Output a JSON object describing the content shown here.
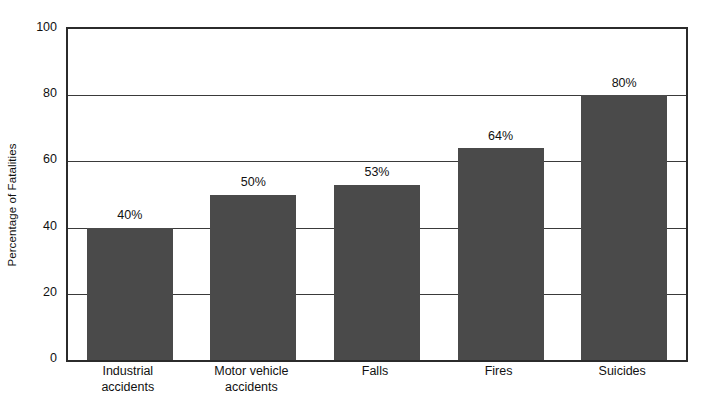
{
  "chart_data": {
    "type": "bar",
    "title": "",
    "xlabel": "",
    "ylabel": "Percentage of Fatalities",
    "ylim": [
      0,
      100
    ],
    "yticks": [
      0,
      20,
      40,
      60,
      80,
      100
    ],
    "grid": "horizontal",
    "legend": "none",
    "orientation": "vertical",
    "bar_color": "#4a4a4a",
    "categories": [
      "Industrial accidents",
      "Motor vehicle accidents",
      "Falls",
      "Fires",
      "Suicides"
    ],
    "category_lines": [
      [
        "Industrial",
        "accidents"
      ],
      [
        "Motor vehicle",
        "accidents"
      ],
      [
        "Falls",
        ""
      ],
      [
        "Fires",
        ""
      ],
      [
        "Suicides",
        ""
      ]
    ],
    "values": [
      40,
      50,
      53,
      64,
      80
    ],
    "data_labels": [
      "40%",
      "50%",
      "53%",
      "64%",
      "80%"
    ]
  },
  "axes": {
    "y_tick_labels": [
      "0",
      "20",
      "40",
      "60",
      "80",
      "100"
    ],
    "y_title": "Percentage of Fatalities"
  },
  "colors": {
    "bar": "#4a4a4a",
    "axis": "#2b2b2b",
    "gridline": "#3a3a3a",
    "text": "#111111",
    "background": "#ffffff"
  }
}
